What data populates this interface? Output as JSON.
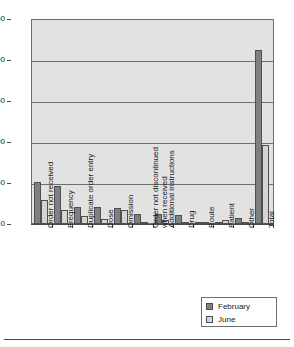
{
  "chart_data": {
    "type": "bar",
    "title": "",
    "xlabel": "",
    "ylabel": "",
    "ylim": [
      0,
      250
    ],
    "yticks": [
      0,
      50,
      100,
      150,
      200,
      250
    ],
    "grid": true,
    "legend_position": "bottom-right",
    "categories": [
      "Order not received",
      "Frequency",
      "Duplicate order entry",
      "Dose",
      "Omission",
      "Order not discontinued\nwhen received",
      "Additional instructions",
      "Drug",
      "Route",
      "Patient",
      "Other",
      "Total"
    ],
    "series": [
      {
        "name": "February",
        "color": "#808080",
        "values": [
          51,
          47,
          21,
          21,
          20,
          12,
          12,
          11,
          2,
          3,
          7,
          213
        ]
      },
      {
        "name": "June",
        "color": "#d4d4d4",
        "values": [
          29,
          17,
          10,
          6,
          17,
          2,
          5,
          1,
          2,
          5,
          3,
          97
        ]
      }
    ]
  },
  "legend": {
    "items": [
      {
        "label": "February",
        "color": "#808080"
      },
      {
        "label": "June",
        "color": "#d4d4d4"
      }
    ]
  },
  "axis": {
    "y_tick_labels": [
      "250",
      "200",
      "150",
      "100",
      "50",
      "0"
    ]
  }
}
